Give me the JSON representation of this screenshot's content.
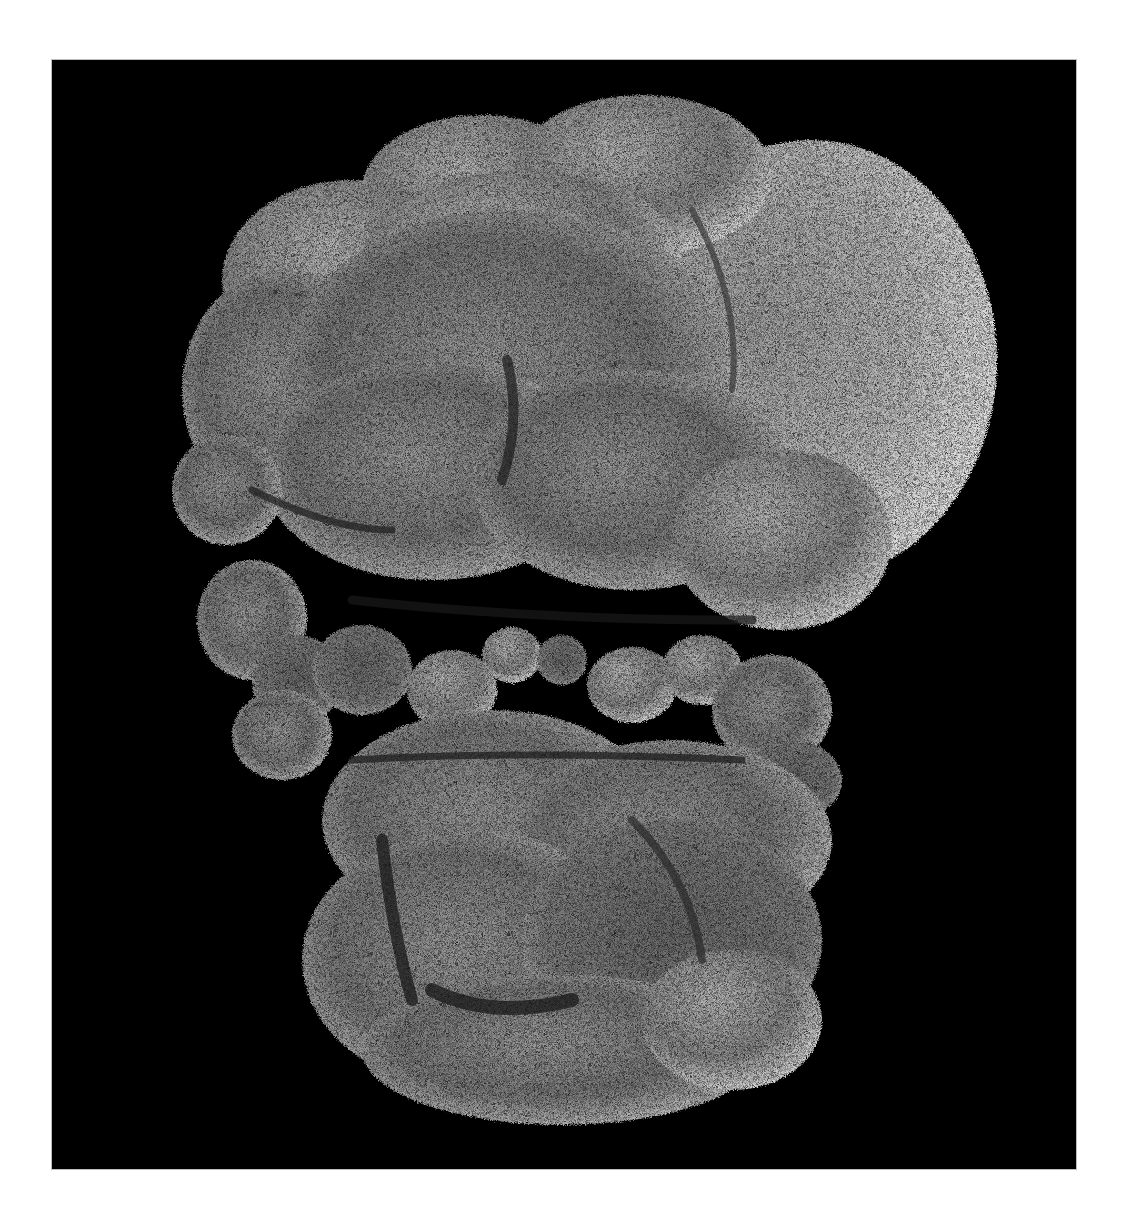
{
  "image": {
    "kind": "scanning electron micrograph",
    "subject": "multicellular cluster with microvilli-covered cell surfaces",
    "color_mode": "grayscale",
    "background_color": "#000000",
    "border_color": "#ffffff",
    "frame": {
      "left": 52,
      "top": 60,
      "width": 1024,
      "height": 1109
    },
    "regions": [
      {
        "name": "upper-cluster",
        "description": "large rounded cells forming the upper mass"
      },
      {
        "name": "right-lobe",
        "description": "large bright smooth-edged lobe on the right"
      },
      {
        "name": "middle-band",
        "description": "row of small spherical cells across the middle"
      },
      {
        "name": "lower-cluster",
        "description": "lower mass of folded cells with dark crevices"
      }
    ],
    "tones": {
      "highlight": "#d6d6d6",
      "midtone": "#8a8a8a",
      "shadow": "#2a2a2a"
    }
  }
}
